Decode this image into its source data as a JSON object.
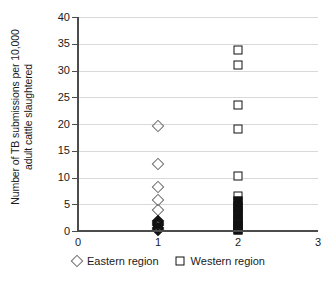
{
  "chart_data": {
    "type": "scatter",
    "title": "",
    "xlabel": "",
    "ylabel": "Number of TB submissions per 10,000 adult cattle slaughtered",
    "ylabel_line1": "Number of TB submissions per 10,000",
    "ylabel_line2": "adult cattle slaughtered",
    "xlim": [
      0,
      3
    ],
    "ylim": [
      0,
      40
    ],
    "xticks": [
      "0",
      "1",
      "2",
      "3"
    ],
    "xtick_values": [
      0,
      1,
      2,
      3
    ],
    "yticks": [
      "0",
      "5",
      "10",
      "15",
      "20",
      "25",
      "30",
      "35",
      "40"
    ],
    "ytick_values": [
      0,
      5,
      10,
      15,
      20,
      25,
      30,
      35,
      40
    ],
    "grid": "horizontal",
    "legend_position": "below-axes",
    "series": [
      {
        "name": "Eastern region",
        "marker": "diamond",
        "color": "#6e6e6e",
        "x": 1,
        "values": [
          19.7,
          12.5,
          8.3,
          5.8,
          4.0,
          1.9,
          1.5,
          1.1,
          0.6,
          0.2
        ]
      },
      {
        "name": "Western region",
        "marker": "square",
        "color": "#111111",
        "x": 2,
        "values": [
          33.9,
          31.1,
          23.6,
          19.1,
          10.3,
          6.5,
          5.6,
          4.7,
          3.9,
          3.1,
          2.3,
          1.6,
          1.0,
          0.5,
          0.1
        ]
      }
    ]
  },
  "legend": {
    "items": [
      {
        "label": "Eastern region",
        "glyph": "diamond-icon"
      },
      {
        "label": "Western region",
        "glyph": "square-icon"
      }
    ]
  }
}
